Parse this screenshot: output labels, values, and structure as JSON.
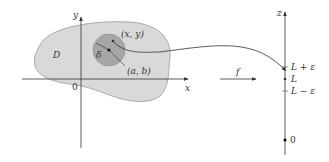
{
  "diagram": {
    "region_label": "D",
    "delta_label": "δ",
    "point_xy_label": "(x, y)",
    "point_ab_label": "(a, b)",
    "origin_left_label": "0",
    "x_axis_label": "x",
    "y_axis_label": "y",
    "function_label": "f",
    "z_axis_label": "z",
    "l_plus_eps_label": "L + ε",
    "l_label": "L",
    "l_minus_eps_label": "L − ε",
    "origin_right_label": "0",
    "colors": {
      "region_fill": "#d9d9d9",
      "region_stroke": "#9a9a9a",
      "disk_fill": "#a6a6a6",
      "disk_stroke": "#8a8a8a",
      "line": "#333333"
    }
  }
}
